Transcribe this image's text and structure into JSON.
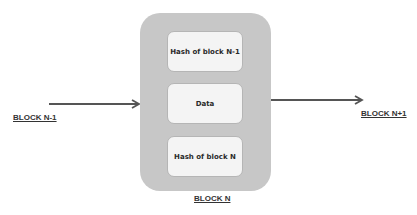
{
  "diagram": {
    "type": "blockchain-block-structure",
    "center_block": {
      "label": "BLOCK N",
      "fields": [
        {
          "label": "Hash of block N-1"
        },
        {
          "label": "Data"
        },
        {
          "label": "Hash of block N"
        }
      ]
    },
    "previous_block": {
      "label": "BLOCK N-1"
    },
    "next_block": {
      "label": "BLOCK N+1"
    },
    "edges": [
      {
        "from": "BLOCK N-1",
        "to": "BLOCK N"
      },
      {
        "from": "BLOCK N",
        "to": "BLOCK N+1"
      }
    ],
    "colors": {
      "outer_block": "#c7c7c7",
      "inner_box": "#f4f4f4",
      "arrow": "#555555",
      "text": "#333333"
    }
  }
}
